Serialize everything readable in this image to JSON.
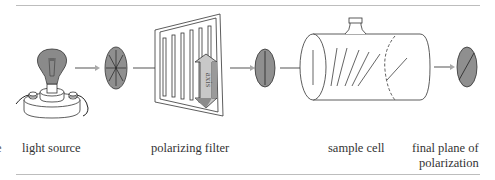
{
  "diagram": {
    "type": "polarimeter-schematic",
    "stages": [
      {
        "id": "light-source",
        "label": "light source"
      },
      {
        "id": "unpolarized-light",
        "label": ""
      },
      {
        "id": "polarizing-filter",
        "label": "polarizing filter",
        "axis_label": "axis"
      },
      {
        "id": "plane-polarized-light",
        "label": ""
      },
      {
        "id": "sample-cell",
        "label": "sample cell"
      },
      {
        "id": "final-plane",
        "label_line1": "final plane of",
        "label_line2": "polarization"
      }
    ],
    "left_cut_text": "e",
    "colors": {
      "disc_fill": "#8f8f8f",
      "bulb_fill": "#8a8a8a",
      "arrow_gray": "#a9a9a9",
      "line": "#333333",
      "rule": "#bdbdbd"
    }
  }
}
